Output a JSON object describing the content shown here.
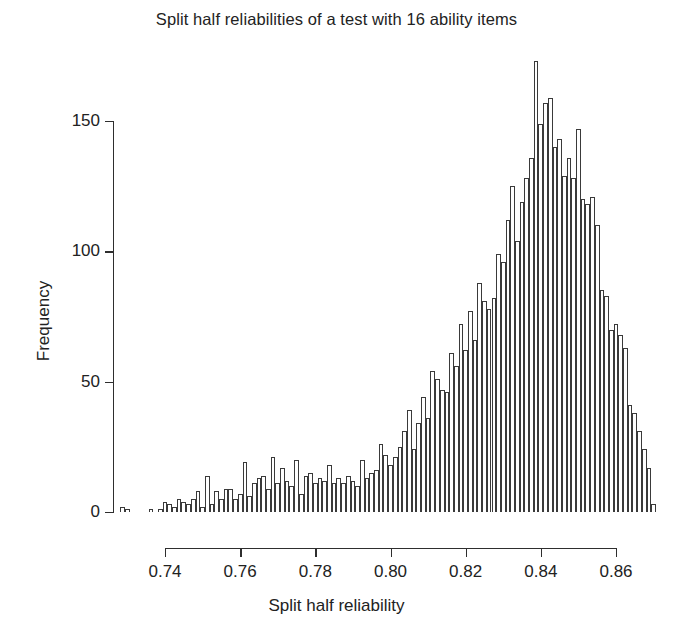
{
  "chart_data": {
    "type": "bar",
    "title": "Split half reliabilities of a test with 16 ability items",
    "xlabel": "Split half reliability",
    "ylabel": "Frequency",
    "xlim": [
      0.7275,
      0.8715
    ],
    "ylim": [
      0,
      175
    ],
    "grid": false,
    "legend": null,
    "bin_width": 0.00125,
    "x_ticks": [
      0.74,
      0.76,
      0.78,
      0.8,
      0.82,
      0.84,
      0.86
    ],
    "x_tick_labels": [
      "0.74",
      "0.76",
      "0.78",
      "0.80",
      "0.82",
      "0.84",
      "0.86"
    ],
    "y_ticks": [
      0,
      50,
      100,
      150
    ],
    "y_tick_labels": [
      "0",
      "50",
      "100",
      "150"
    ],
    "bar_color": "#ffffff",
    "bar_edge_color": "#3a3a3a",
    "axis_color": "#2e2e2e",
    "bin_centers": [
      0.72875,
      0.73,
      0.73125,
      0.7325,
      0.73375,
      0.735,
      0.73625,
      0.7375,
      0.73875,
      0.74,
      0.74125,
      0.7425,
      0.74375,
      0.745,
      0.74625,
      0.7475,
      0.74875,
      0.75,
      0.75125,
      0.7525,
      0.75375,
      0.755,
      0.75625,
      0.7575,
      0.75875,
      0.76,
      0.76125,
      0.7625,
      0.76375,
      0.765,
      0.76625,
      0.7675,
      0.76875,
      0.77,
      0.77125,
      0.7725,
      0.77375,
      0.775,
      0.77625,
      0.7775,
      0.77875,
      0.78,
      0.78125,
      0.7825,
      0.78375,
      0.785,
      0.78625,
      0.7875,
      0.78875,
      0.79,
      0.79125,
      0.7925,
      0.79375,
      0.795,
      0.79625,
      0.7975,
      0.79875,
      0.8,
      0.80125,
      0.8025,
      0.80375,
      0.805,
      0.80625,
      0.8075,
      0.80875,
      0.81,
      0.81125,
      0.8125,
      0.81375,
      0.815,
      0.81625,
      0.8175,
      0.81875,
      0.82,
      0.82125,
      0.8225,
      0.82375,
      0.825,
      0.82625,
      0.8275,
      0.82875,
      0.83,
      0.83125,
      0.8325,
      0.83375,
      0.835,
      0.83625,
      0.8375,
      0.83875,
      0.84,
      0.84125,
      0.8425,
      0.84375,
      0.845,
      0.84625,
      0.8475,
      0.84875,
      0.85,
      0.85125,
      0.8525,
      0.85375,
      0.855,
      0.85625,
      0.8575,
      0.85875,
      0.86,
      0.86125,
      0.8625,
      0.86375,
      0.865,
      0.86625,
      0.8675,
      0.86875,
      0.87
    ],
    "frequencies": [
      2,
      1,
      0,
      0,
      0,
      0,
      1,
      0,
      1,
      4,
      3,
      2,
      5,
      4,
      3,
      5,
      8,
      2,
      14,
      3,
      8,
      5,
      9,
      9,
      5,
      7,
      19,
      6,
      11,
      13,
      14,
      9,
      21,
      11,
      17,
      12,
      10,
      20,
      7,
      14,
      15,
      11,
      13,
      12,
      18,
      11,
      13,
      11,
      14,
      12,
      10,
      20,
      13,
      15,
      16,
      26,
      22,
      18,
      21,
      25,
      31,
      39,
      24,
      34,
      44,
      36,
      54,
      51,
      47,
      46,
      61,
      56,
      72,
      62,
      77,
      66,
      88,
      81,
      78,
      82,
      99,
      96,
      112,
      125,
      104,
      119,
      128,
      136,
      173,
      149,
      157,
      159,
      140,
      143,
      129,
      136,
      128,
      147,
      120,
      118,
      121,
      110,
      85,
      83,
      70,
      72,
      68,
      63,
      41,
      38,
      31,
      24,
      17,
      3
    ]
  }
}
